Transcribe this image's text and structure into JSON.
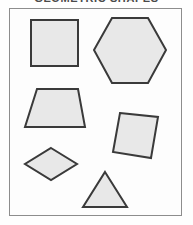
{
  "page": {
    "title": "GEOMETRIC SHAPES",
    "title_clipped": true,
    "background_color": "#fefefe"
  },
  "frame": {
    "border_color": "#8d8d8d",
    "fill_color": "#fdfdfd",
    "x": 9,
    "y": 8,
    "width": 173,
    "height": 208
  },
  "style": {
    "shape_fill": "#e8e8e8",
    "shape_stroke": "#3a3a3a",
    "stroke_width": 2
  },
  "shapes": [
    {
      "name": "square",
      "label": "Square",
      "sides": 4,
      "points": "31,20 78,20 78,66 31,66"
    },
    {
      "name": "hexagon",
      "label": "Hexagon",
      "sides": 6,
      "points": "112,18 148,18 166,50 148,83 112,83 94,50"
    },
    {
      "name": "trapezoid",
      "label": "Trapezoid",
      "sides": 4,
      "points": "37,89 78,89 85,127 25,127"
    },
    {
      "name": "parallelogram",
      "label": "Parallelogram",
      "sides": 4,
      "points": "120,113 158,117 151,158 113,152"
    },
    {
      "name": "rhombus",
      "label": "Rhombus",
      "sides": 4,
      "points": "51,148 77,164 51,180 25,164"
    },
    {
      "name": "triangle",
      "label": "Triangle",
      "sides": 3,
      "points": "105,172 127,207 83,207"
    }
  ]
}
